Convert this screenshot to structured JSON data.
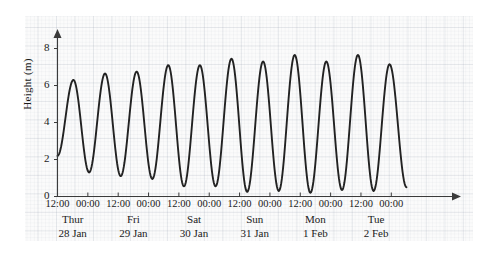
{
  "chart_data": {
    "type": "line",
    "title": "",
    "subtitle": "",
    "xlabel": "",
    "ylabel": "Height (m)",
    "ylim": [
      0,
      9
    ],
    "xlim": [
      0,
      156
    ],
    "grid": true,
    "legend": null,
    "y_ticks": [
      {
        "value": 8,
        "label": "8"
      },
      {
        "value": 6,
        "label": "6"
      },
      {
        "value": 4,
        "label": "4"
      },
      {
        "value": 2,
        "label": "2"
      },
      {
        "value": 0,
        "label": "0"
      }
    ],
    "x_ticks": [
      {
        "hours": 0,
        "label": "12:00"
      },
      {
        "hours": 12,
        "label": "00:00"
      },
      {
        "hours": 24,
        "label": "12:00"
      },
      {
        "hours": 36,
        "label": "00:00"
      },
      {
        "hours": 48,
        "label": "12:00"
      },
      {
        "hours": 60,
        "label": "00:00"
      },
      {
        "hours": 72,
        "label": "12:00"
      },
      {
        "hours": 84,
        "label": "00:00"
      },
      {
        "hours": 96,
        "label": "12:00"
      },
      {
        "hours": 108,
        "label": "00:00"
      },
      {
        "hours": 120,
        "label": "12:00"
      },
      {
        "hours": 132,
        "label": "00:00"
      }
    ],
    "day_labels": [
      {
        "hours": 6,
        "name": "Thur",
        "date": "28 Jan"
      },
      {
        "hours": 30,
        "name": "Fri",
        "date": "29 Jan"
      },
      {
        "hours": 54,
        "name": "Sat",
        "date": "30 Jan"
      },
      {
        "hours": 78,
        "name": "Sun",
        "date": "31 Jan"
      },
      {
        "hours": 102,
        "name": "Mon",
        "date": "1 Feb"
      },
      {
        "hours": 126,
        "name": "Tue",
        "date": "2 Feb"
      }
    ],
    "series": [
      {
        "name": "Tide height",
        "color": "#222222",
        "units": "m",
        "x_units": "hours since 12:00 Thur 28 Jan",
        "extrema": [
          {
            "x": 0,
            "y": 2.2,
            "kind": "start"
          },
          {
            "x": 6.3,
            "y": 6.3,
            "kind": "high"
          },
          {
            "x": 12.5,
            "y": 1.3,
            "kind": "low"
          },
          {
            "x": 18.8,
            "y": 6.65,
            "kind": "high"
          },
          {
            "x": 25.0,
            "y": 1.1,
            "kind": "low"
          },
          {
            "x": 31.3,
            "y": 6.75,
            "kind": "high"
          },
          {
            "x": 37.5,
            "y": 0.95,
            "kind": "low"
          },
          {
            "x": 43.8,
            "y": 7.1,
            "kind": "high"
          },
          {
            "x": 50.0,
            "y": 0.55,
            "kind": "low"
          },
          {
            "x": 56.3,
            "y": 7.1,
            "kind": "high"
          },
          {
            "x": 62.5,
            "y": 0.55,
            "kind": "low"
          },
          {
            "x": 68.8,
            "y": 7.45,
            "kind": "high"
          },
          {
            "x": 75.0,
            "y": 0.25,
            "kind": "low"
          },
          {
            "x": 81.3,
            "y": 7.3,
            "kind": "high"
          },
          {
            "x": 87.5,
            "y": 0.3,
            "kind": "low"
          },
          {
            "x": 93.8,
            "y": 7.65,
            "kind": "high"
          },
          {
            "x": 100.0,
            "y": 0.2,
            "kind": "low"
          },
          {
            "x": 106.3,
            "y": 7.3,
            "kind": "high"
          },
          {
            "x": 112.5,
            "y": 0.35,
            "kind": "low"
          },
          {
            "x": 118.8,
            "y": 7.65,
            "kind": "high"
          },
          {
            "x": 125.0,
            "y": 0.3,
            "kind": "low"
          },
          {
            "x": 131.3,
            "y": 7.15,
            "kind": "high"
          },
          {
            "x": 138.0,
            "y": 0.5,
            "kind": "end"
          }
        ]
      }
    ]
  }
}
